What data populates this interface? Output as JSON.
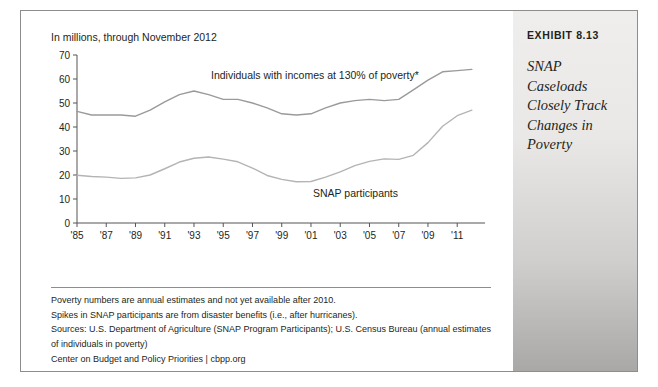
{
  "exhibit": {
    "label": "EXHIBIT 8.13",
    "title": "SNAP Caseloads Closely Track Changes in Poverty"
  },
  "chart_caption": "In millions, through November 2012",
  "notes": {
    "line1": "Poverty numbers are annual estimates and not yet available after 2010.",
    "line2": "Spikes in SNAP participants are from disaster benefits (i.e., after hurricanes).",
    "line3": "Sources: U.S. Department of Agriculture (SNAP Program Participants); U.S. Census Bureau (annual estimates",
    "line4": "of individuals in poverty)",
    "line5": "Center on Budget and Policy Priorities | cbpp.org"
  },
  "chart_data": {
    "type": "line",
    "title": "",
    "subtitle": "In millions, through November 2012",
    "xlabel": "",
    "ylabel": "",
    "ylim": [
      0,
      70
    ],
    "yticks": [
      0,
      10,
      20,
      30,
      40,
      50,
      60,
      70
    ],
    "ytick_labels": [
      "0",
      "10",
      "20",
      "30",
      "40",
      "50",
      "60",
      "70"
    ],
    "xlim": [
      1985,
      2012.9
    ],
    "xticks": [
      1985,
      1987,
      1989,
      1991,
      1993,
      1995,
      1997,
      1999,
      2001,
      2003,
      2005,
      2007,
      2009,
      2011
    ],
    "xtick_labels": [
      "'85",
      "'87",
      "'89",
      "'91",
      "'93",
      "'95",
      "'97",
      "'99",
      "'01",
      "'03",
      "'05",
      "'07",
      "'09",
      "'11"
    ],
    "grid": false,
    "legend": "inline-annotations",
    "annotations": [
      {
        "text": "Individuals with incomes at 130% of poverty*",
        "x": 1993.2,
        "y": 65.5
      },
      {
        "text": "SNAP participants",
        "x": 2004.5,
        "y": 16.5
      }
    ],
    "series": [
      {
        "name": "Individuals with incomes at 130% of poverty*",
        "color": "#9a9a9a",
        "x": [
          1985,
          1986,
          1987,
          1988,
          1989,
          1990,
          1991,
          1992,
          1993,
          1994,
          1995,
          1996,
          1997,
          1998,
          1999,
          2000,
          2001,
          2002,
          2003,
          2004,
          2005,
          2006,
          2007,
          2008,
          2009,
          2010,
          2011,
          2012
        ],
        "values": [
          46.5,
          45.0,
          45.0,
          45.0,
          44.5,
          47.0,
          50.5,
          53.5,
          55.0,
          53.5,
          51.5,
          51.5,
          50.0,
          48.0,
          45.5,
          45.0,
          45.5,
          48.0,
          50.0,
          51.0,
          51.5,
          51.0,
          51.5,
          55.5,
          59.5,
          63.0,
          63.5,
          64.0
        ]
      },
      {
        "name": "SNAP participants",
        "color": "#b4b4b4",
        "x": [
          1985,
          1986,
          1987,
          1988,
          1989,
          1990,
          1991,
          1992,
          1993,
          1994,
          1995,
          1996,
          1997,
          1998,
          1999,
          2000,
          2001,
          2002,
          2003,
          2004,
          2005,
          2006,
          2007,
          2008,
          2009,
          2010,
          2011,
          2012
        ],
        "values": [
          19.9,
          19.4,
          19.1,
          18.6,
          18.8,
          20.0,
          22.6,
          25.4,
          27.0,
          27.5,
          26.6,
          25.5,
          22.9,
          19.8,
          18.2,
          17.2,
          17.3,
          19.1,
          21.3,
          23.9,
          25.7,
          26.7,
          26.5,
          28.2,
          33.5,
          40.3,
          44.7,
          47.0
        ]
      }
    ]
  }
}
